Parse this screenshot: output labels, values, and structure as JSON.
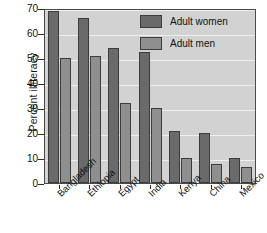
{
  "chart_data": {
    "type": "bar",
    "title": "",
    "xlabel": "",
    "ylabel": "Percent illiteracy",
    "ylim": [
      0,
      70
    ],
    "yticks": [
      0,
      10,
      20,
      30,
      40,
      50,
      60,
      70
    ],
    "grid": true,
    "legend_position": "top-right",
    "categories": [
      "Bangladesh",
      "Ethiopia",
      "Egypt",
      "India",
      "Kenya",
      "China",
      "Mexico"
    ],
    "series": [
      {
        "name": "Adult women",
        "color": "#6a6a6a",
        "values": [
          69,
          66,
          54,
          52.5,
          21,
          20,
          10
        ]
      },
      {
        "name": "Adult men",
        "color": "#8f8f8f",
        "values": [
          50,
          51,
          32,
          30,
          10,
          7.5,
          6.5
        ]
      }
    ]
  },
  "legend": {
    "items": [
      {
        "label": "Adult women",
        "swatch": "women"
      },
      {
        "label": "Adult men",
        "swatch": "men"
      }
    ]
  },
  "colors": {
    "plot_background": "#d2d2d2",
    "gridline": "#efefef",
    "axis": "#4a4a4a",
    "women": "#6a6a6a",
    "men": "#8f8f8f"
  }
}
